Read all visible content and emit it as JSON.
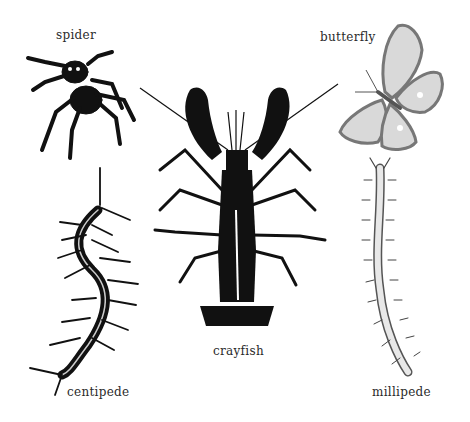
{
  "labels": {
    "spider": "spider",
    "butterfly": "butterfly",
    "crayfish": "crayfish",
    "centipede": "centipede",
    "millipede": "millipede"
  },
  "colors": {
    "ink": "#111111",
    "label": "#2a2a2a",
    "butterfly_wing": "#d9d9d9",
    "butterfly_border": "#777777",
    "millipede_body": "#e8e8e8",
    "background": "#ffffff"
  }
}
